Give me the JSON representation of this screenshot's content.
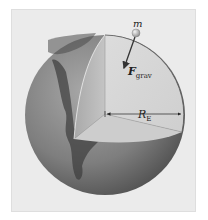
{
  "figure": {
    "labels": {
      "mass": "m",
      "force_main": "F",
      "force_sub": "grav",
      "radius_main": "R",
      "radius_sub": "E"
    },
    "colors": {
      "background": "#ffffff",
      "panel": "#ebebeb",
      "sphere_surface": "#8a8a8a",
      "cut_face_right": "#d9d9d9",
      "cut_face_left": "#b9b9b9",
      "cut_face_bottom": "#cfcfcf",
      "arrow": "#333333",
      "mass_ball": "#c8c8c8"
    }
  }
}
